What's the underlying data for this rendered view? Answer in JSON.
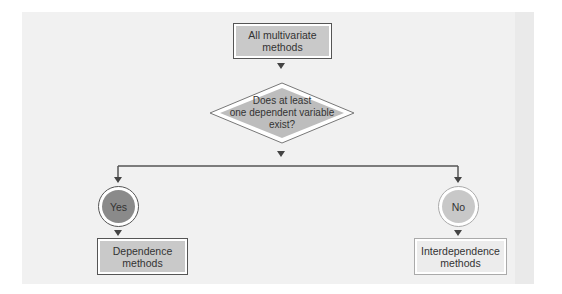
{
  "diagram": {
    "start": {
      "label_line1": "All multivariate",
      "label_line2": "methods"
    },
    "decision": {
      "line1": "Does at least",
      "line2": "one dependent variable",
      "line3": "exist?"
    },
    "branches": [
      {
        "answer": "Yes",
        "result_line1": "Dependence",
        "result_line2": "methods"
      },
      {
        "answer": "No",
        "result_line1": "Interdependence",
        "result_line2": "methods"
      }
    ],
    "colors": {
      "panel": "#f1f1f1",
      "dark_fill": "#c9c9c9",
      "yes_circle": "#8a8a8a",
      "no_circle": "#c8c8c8",
      "line": "#555555"
    }
  }
}
